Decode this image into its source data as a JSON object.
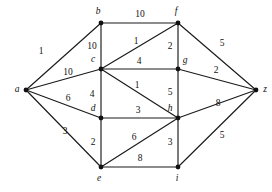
{
  "figure": {
    "background_color": "#ffffff",
    "edge_color": "#1a1a1a",
    "node_color": "#111111",
    "label_color": "#111111"
  },
  "chart_data": {
    "type": "diagram",
    "title": "",
    "xlabel": "",
    "ylabel": "",
    "grid": false,
    "legend": "none",
    "graph_kind": "weighted-undirected-graph",
    "nodes": [
      {
        "id": "a",
        "label": "a",
        "x": 26,
        "y": 90,
        "label_x": 17,
        "label_y": 90
      },
      {
        "id": "b",
        "label": "b",
        "x": 101,
        "y": 23,
        "label_x": 98,
        "label_y": 12
      },
      {
        "id": "c",
        "label": "c",
        "x": 101,
        "y": 69,
        "label_x": 93,
        "label_y": 60
      },
      {
        "id": "d",
        "label": "d",
        "x": 101,
        "y": 118,
        "label_x": 93,
        "label_y": 109
      },
      {
        "id": "e",
        "label": "e",
        "x": 101,
        "y": 167,
        "label_x": 99,
        "label_y": 179
      },
      {
        "id": "f",
        "label": "f",
        "x": 178,
        "y": 23,
        "label_x": 176,
        "label_y": 12
      },
      {
        "id": "g",
        "label": "g",
        "x": 178,
        "y": 69,
        "label_x": 185,
        "label_y": 61
      },
      {
        "id": "h",
        "label": "h",
        "x": 178,
        "y": 118,
        "label_x": 170,
        "label_y": 109
      },
      {
        "id": "i",
        "label": "i",
        "x": 178,
        "y": 167,
        "label_x": 177,
        "label_y": 179
      },
      {
        "id": "z",
        "label": "z",
        "x": 256,
        "y": 90,
        "label_x": 265,
        "label_y": 90
      }
    ],
    "edges": [
      {
        "from": "a",
        "to": "b",
        "weight": 1,
        "label_x": 41,
        "label_y": 52
      },
      {
        "from": "a",
        "to": "c",
        "weight": 10,
        "label_x": 68,
        "label_y": 73
      },
      {
        "from": "a",
        "to": "d",
        "weight": 6,
        "label_x": 68,
        "label_y": 99
      },
      {
        "from": "a",
        "to": "e",
        "weight": 3,
        "label_x": 65,
        "label_y": 132
      },
      {
        "from": "b",
        "to": "c",
        "weight": 10,
        "label_x": 92,
        "label_y": 47
      },
      {
        "from": "b",
        "to": "f",
        "weight": 10,
        "label_x": 140,
        "label_y": 15
      },
      {
        "from": "c",
        "to": "f",
        "weight": 1,
        "label_x": 136,
        "label_y": 42
      },
      {
        "from": "c",
        "to": "g",
        "weight": 4,
        "label_x": 139,
        "label_y": 62
      },
      {
        "from": "c",
        "to": "d",
        "weight": 4,
        "label_x": 92,
        "label_y": 95
      },
      {
        "from": "c",
        "to": "h",
        "weight": 1,
        "label_x": 137,
        "label_y": 86
      },
      {
        "from": "d",
        "to": "h",
        "weight": 3,
        "label_x": 138,
        "label_y": 111
      },
      {
        "from": "d",
        "to": "e",
        "weight": 2,
        "label_x": 93,
        "label_y": 143
      },
      {
        "from": "e",
        "to": "h",
        "weight": 6,
        "label_x": 134,
        "label_y": 138
      },
      {
        "from": "e",
        "to": "i",
        "weight": 8,
        "label_x": 140,
        "label_y": 159
      },
      {
        "from": "f",
        "to": "g",
        "weight": 2,
        "label_x": 170,
        "label_y": 47
      },
      {
        "from": "f",
        "to": "z",
        "weight": 5,
        "label_x": 222,
        "label_y": 44
      },
      {
        "from": "g",
        "to": "h",
        "weight": 5,
        "label_x": 170,
        "label_y": 93
      },
      {
        "from": "g",
        "to": "z",
        "weight": 2,
        "label_x": 216,
        "label_y": 71
      },
      {
        "from": "h",
        "to": "i",
        "weight": 3,
        "label_x": 170,
        "label_y": 143
      },
      {
        "from": "h",
        "to": "z",
        "weight": 8,
        "label_x": 218,
        "label_y": 104
      },
      {
        "from": "i",
        "to": "z",
        "weight": 5,
        "label_x": 222,
        "label_y": 136
      }
    ]
  }
}
